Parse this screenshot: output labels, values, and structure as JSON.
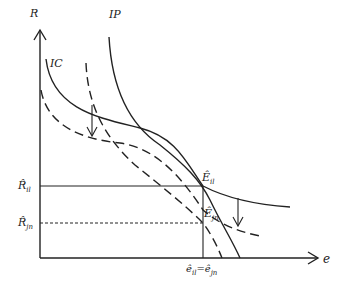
{
  "diagram": {
    "axes": {
      "y_label": "R",
      "x_label": "e"
    },
    "curves": {
      "ic_label": "IC",
      "ip_label": "IP"
    },
    "points": {
      "e_il": "Ê",
      "e_il_sub": "il",
      "e_jn": "Ê",
      "e_jn_sub": "jn"
    },
    "y_ticks": {
      "r_il": "R̂",
      "r_il_sub": "il",
      "r_jn": "R̂",
      "r_jn_sub": "jn"
    },
    "x_ticks": {
      "e_eq": "ê",
      "e_eq_sub1": "il",
      "e_eq_mid": "=ê",
      "e_eq_sub2": "jn"
    },
    "colors": {
      "line": "#222222",
      "background": "#ffffff"
    }
  }
}
